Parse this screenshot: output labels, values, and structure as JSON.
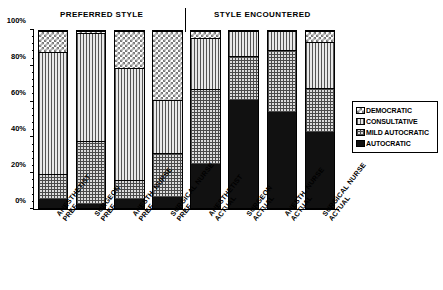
{
  "headings": {
    "preferred": "PREFERRED STYLE",
    "encountered": "STYLE ENCOUNTERED"
  },
  "legend": {
    "items": [
      {
        "label": "DEMOCRATIC",
        "key": "democratic",
        "swatch": "checkerboard-swatch"
      },
      {
        "label": "CONSULTATIVE",
        "key": "consultative",
        "swatch": "vertical-stripe-swatch"
      },
      {
        "label": "MILD AUTOCRATIC",
        "key": "mild",
        "swatch": "crosshatch-swatch"
      },
      {
        "label": "AUTOCRATIC",
        "key": "autocratic",
        "swatch": "solid-black-swatch"
      }
    ]
  },
  "chart_data": {
    "type": "bar",
    "subtype": "stacked-100-percent",
    "title": "",
    "xlabel": "",
    "ylabel": "",
    "ylim": [
      0,
      100
    ],
    "yticks": [
      0,
      20,
      40,
      60,
      80,
      100
    ],
    "ytick_labels": [
      "0%",
      "20%",
      "40%",
      "60%",
      "80%",
      "100%"
    ],
    "grid": false,
    "legend_position": "right",
    "groups": [
      "PREFERRED STYLE",
      "STYLE ENCOUNTERED"
    ],
    "categories": [
      {
        "line1": "ANESTHETIST",
        "line2": "PREF",
        "group": "PREFERRED STYLE"
      },
      {
        "line1": "SURGEON",
        "line2": "PREF",
        "group": "PREFERRED STYLE"
      },
      {
        "line1": "ANESTH. NURSE",
        "line2": "PREF",
        "group": "PREFERRED STYLE"
      },
      {
        "line1": "SURGICAL NURSE",
        "line2": "PREF",
        "group": "PREFERRED STYLE"
      },
      {
        "line1": "ANESTHETIST",
        "line2": "ACTUAL",
        "group": "STYLE ENCOUNTERED"
      },
      {
        "line1": "SURGEON",
        "line2": "ACTUAL",
        "group": "STYLE ENCOUNTERED"
      },
      {
        "line1": "ANESTH. NURSE",
        "line2": "ACTUAL",
        "group": "STYLE ENCOUNTERED"
      },
      {
        "line1": "SURGICAL NURSE",
        "line2": "ACTUAL",
        "group": "STYLE ENCOUNTERED"
      }
    ],
    "series": [
      {
        "name": "AUTOCRATIC",
        "key": "autocratic",
        "values": [
          5,
          2,
          5,
          6,
          25,
          61,
          54,
          43
        ]
      },
      {
        "name": "MILD AUTOCRATIC",
        "key": "mild",
        "values": [
          14,
          36,
          11,
          25,
          42,
          25,
          35,
          25
        ]
      },
      {
        "name": "CONSULTATIVE",
        "key": "consultative",
        "values": [
          69,
          61,
          63,
          30,
          29,
          14,
          11,
          26
        ]
      },
      {
        "name": "DEMOCRATIC",
        "key": "democratic",
        "values": [
          12,
          1,
          21,
          39,
          4,
          0,
          0,
          6
        ]
      }
    ],
    "cumulative_tops": {
      "autocratic": [
        5,
        2,
        5,
        6,
        25,
        61,
        54,
        43
      ],
      "mild": [
        19,
        38,
        16,
        31,
        67,
        86,
        89,
        68
      ],
      "consultative": [
        88,
        99,
        79,
        61,
        96,
        100,
        100,
        94
      ],
      "democratic": [
        100,
        100,
        100,
        100,
        100,
        100,
        100,
        100
      ]
    }
  }
}
